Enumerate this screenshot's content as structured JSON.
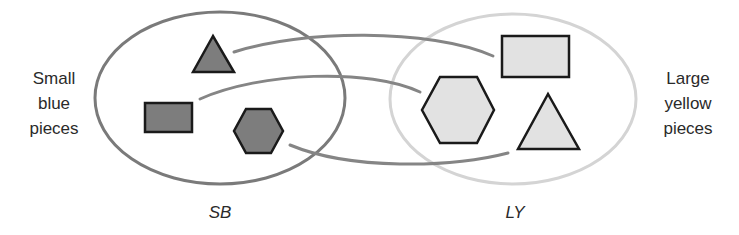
{
  "diagram": {
    "type": "mapping-between-sets",
    "sets": [
      {
        "id": "SB",
        "name": "SB",
        "description_lines": [
          "Small",
          "blue",
          "pieces"
        ],
        "ellipse": {
          "cx": 220,
          "cy": 98,
          "rx": 125,
          "ry": 86,
          "stroke": "#7a7a7a",
          "stroke_width": 3
        },
        "shape_fill": "#7d7d7d",
        "shape_stroke": "#1a1a1a",
        "members": [
          {
            "id": "sb-triangle",
            "shape": "triangle",
            "points": "213,36 193,72 234,72"
          },
          {
            "id": "sb-rectangle",
            "shape": "rectangle",
            "x": 145,
            "y": 103,
            "width": 47,
            "height": 29
          },
          {
            "id": "sb-hexagon",
            "shape": "hexagon",
            "points": "246,109 271,109 283,131 271,153 246,153 234,131"
          }
        ]
      },
      {
        "id": "LY",
        "name": "LY",
        "description_lines": [
          "Large",
          "yellow",
          "pieces"
        ],
        "ellipse": {
          "cx": 513,
          "cy": 99,
          "rx": 123,
          "ry": 85,
          "stroke": "#d4d4d4",
          "stroke_width": 3
        },
        "shape_fill": "#e2e2e2",
        "shape_stroke": "#1a1a1a",
        "members": [
          {
            "id": "ly-rectangle",
            "shape": "rectangle",
            "x": 502,
            "y": 36,
            "width": 67,
            "height": 41
          },
          {
            "id": "ly-hexagon",
            "shape": "hexagon",
            "points": "440,77 477,77 494,110 477,143 440,143 422,110"
          },
          {
            "id": "ly-triangle",
            "shape": "triangle",
            "points": "548,94 518,149 579,149"
          }
        ]
      }
    ],
    "mappings": [
      {
        "from": "sb-triangle",
        "to": "ly-rectangle",
        "path": "M 234 52 C 300 30, 430 28, 493 56"
      },
      {
        "from": "sb-rectangle",
        "to": "ly-hexagon",
        "path": "M 200 99 C 260 72, 370 68, 420 92"
      },
      {
        "from": "sb-hexagon",
        "to": "ly-triangle",
        "path": "M 290 145 C 350 170, 450 168, 508 153"
      }
    ],
    "connector_color": "#858585",
    "connector_width": 3
  }
}
